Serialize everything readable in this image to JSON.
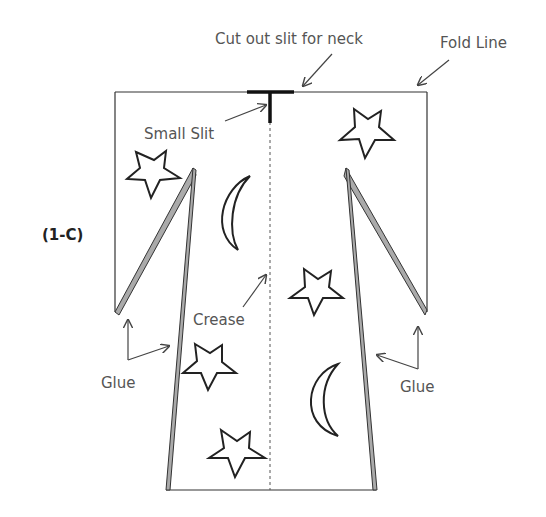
{
  "diagram": {
    "figure_label": "(1-C)",
    "labels": {
      "cut_slit": "Cut out slit for neck",
      "fold_line": "Fold Line",
      "small_slit": "Small Slit",
      "crease": "Crease",
      "glue_left": "Glue",
      "glue_right": "Glue"
    },
    "decorations": {
      "stars": 5,
      "moons": 2
    },
    "colors": {
      "outline": "#333333",
      "glue_strip": "#aaaaaa",
      "label_text": "#555555"
    }
  }
}
